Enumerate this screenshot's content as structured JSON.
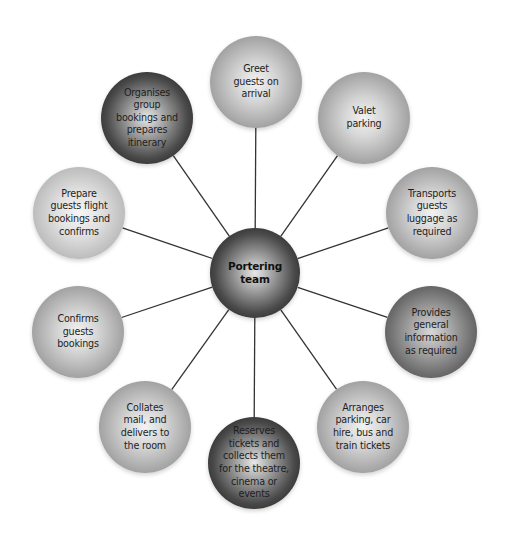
{
  "diagram": {
    "center": {
      "label": "Portering\nteam",
      "x": 255,
      "y": 273,
      "r": 45,
      "shade": "black"
    },
    "nodes": [
      {
        "id": "greet",
        "label": "Greet\nguests on\narrival",
        "x": 256,
        "y": 82,
        "r": 46,
        "shade": "mid"
      },
      {
        "id": "valet",
        "label": "Valet\nparking",
        "x": 364,
        "y": 118,
        "r": 46,
        "shade": "mid"
      },
      {
        "id": "transports",
        "label": "Transports\nguests\nluggage as\nrequired",
        "x": 432,
        "y": 213,
        "r": 46,
        "shade": "mid"
      },
      {
        "id": "provides",
        "label": "Provides\ngeneral\ninformation\nas required",
        "x": 431,
        "y": 332,
        "r": 46,
        "shade": "dark"
      },
      {
        "id": "arranges",
        "label": "Arranges\nparking, car\nhire, bus and\ntrain tickets",
        "x": 363,
        "y": 427,
        "r": 46,
        "shade": "mid"
      },
      {
        "id": "reserves",
        "label": "Reserves\ntickets and\ncollects them\nfor the theatre,\ncinema or\nevents",
        "x": 254,
        "y": 463,
        "r": 46,
        "shade": "black"
      },
      {
        "id": "collates",
        "label": "Collates\nmail, and\ndelivers to\nthe room",
        "x": 145,
        "y": 427,
        "r": 46,
        "shade": "mid"
      },
      {
        "id": "confirms",
        "label": "Confirms\nguests\nbookings",
        "x": 78,
        "y": 332,
        "r": 46,
        "shade": "mid"
      },
      {
        "id": "prepare",
        "label": "Prepare\nguests flight\nbookings and\nconfirms",
        "x": 79,
        "y": 213,
        "r": 46,
        "shade": "light"
      },
      {
        "id": "organises",
        "label": "Organises\ngroup\nbookings and\nprepares\nitinerary",
        "x": 147,
        "y": 118,
        "r": 46,
        "shade": "black"
      }
    ],
    "connector_color": "#333333"
  }
}
